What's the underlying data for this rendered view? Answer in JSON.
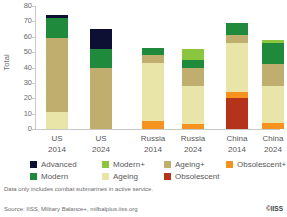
{
  "chart_data": {
    "type": "bar",
    "subtype": "stacked",
    "title": "",
    "xlabel": "",
    "ylabel": "Total",
    "ylim": [
      0,
      80
    ],
    "yticks": [
      0,
      10,
      20,
      30,
      40,
      50,
      60,
      70,
      80
    ],
    "grid": false,
    "legend_position": "bottom",
    "categories": [
      "US 2014",
      "US 2024",
      "Russia 2014",
      "Russia 2024",
      "China 2014",
      "China 2024"
    ],
    "category_lines": [
      [
        "US",
        "2014"
      ],
      [
        "US",
        "2024"
      ],
      [
        "Russia",
        "2014"
      ],
      [
        "Russia",
        "2024"
      ],
      [
        "China",
        "2014"
      ],
      [
        "China",
        "2024"
      ]
    ],
    "series": [
      {
        "name": "Advanced",
        "color": "#0d1033",
        "values": [
          1.5,
          13,
          0,
          0,
          0,
          0
        ]
      },
      {
        "name": "Modern+",
        "color": "#8cc63f",
        "values": [
          0,
          0,
          0,
          7,
          0,
          2
        ]
      },
      {
        "name": "Modern",
        "color": "#1f8a3b",
        "values": [
          13.5,
          12,
          5,
          5,
          8,
          14
        ]
      },
      {
        "name": "Ageing+",
        "color": "#bfae6e",
        "values": [
          48,
          40,
          5,
          12,
          5,
          14
        ]
      },
      {
        "name": "Ageing",
        "color": "#e9e4a8",
        "values": [
          11,
          0,
          38,
          25,
          32,
          24
        ]
      },
      {
        "name": "Obsolescent+",
        "color": "#f6921e",
        "values": [
          0,
          0,
          5,
          3,
          4,
          4
        ]
      },
      {
        "name": "Obsolescent",
        "color": "#b5321b",
        "values": [
          0,
          0,
          0,
          0,
          20,
          0
        ]
      }
    ],
    "totals": [
      74,
      65,
      53,
      52,
      69,
      58
    ],
    "stack_order_bottom_to_top": [
      "Obsolescent",
      "Obsolescent+",
      "Ageing",
      "Ageing+",
      "Modern",
      "Modern+",
      "Advanced"
    ]
  },
  "legend": {
    "items": [
      {
        "label": "Advanced",
        "color": "#0d1033"
      },
      {
        "label": "Modern+",
        "color": "#8cc63f"
      },
      {
        "label": "Ageing+",
        "color": "#bfae6e"
      },
      {
        "label": "Obsolescent+",
        "color": "#f6921e"
      },
      {
        "label": "Modern",
        "color": "#1f8a3b"
      },
      {
        "label": "Ageing",
        "color": "#e9e4a8"
      },
      {
        "label": "Obsolescent",
        "color": "#b5321b"
      }
    ]
  },
  "footnotes": {
    "note": "Data only includes combat submarines in active service.",
    "source": "Source: IISS, Military Balance+, milbalplus.iiss.org",
    "copyright": "©IISS"
  }
}
